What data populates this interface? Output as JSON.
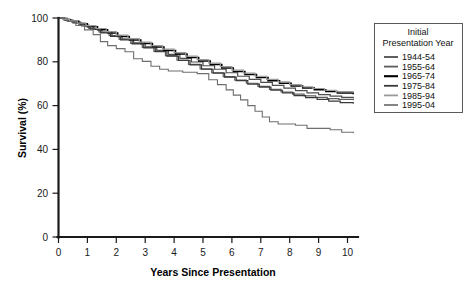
{
  "chart_data": {
    "type": "line",
    "title": "",
    "xlabel": "Years Since Presentation",
    "ylabel": "Survival (%)",
    "xlim": [
      0,
      10.5
    ],
    "ylim": [
      0,
      100
    ],
    "xticks": [
      "0",
      "1",
      "2",
      "3",
      "4",
      "5",
      "6",
      "7",
      "8",
      "9",
      "10"
    ],
    "yticks": [
      "0",
      "20",
      "40",
      "60",
      "80",
      "100"
    ],
    "grid": false,
    "legend_position": "top-right",
    "legend_title_line1": "Initial",
    "legend_title_line2": "Presentation Year",
    "series": [
      {
        "name": "1944-54",
        "color": "#4d4d4d",
        "width": 1.2,
        "points": [
          [
            0,
            100
          ],
          [
            0.15,
            99.4
          ],
          [
            0.35,
            98.6
          ],
          [
            0.6,
            97.6
          ],
          [
            0.9,
            96.3
          ],
          [
            1.2,
            94.8
          ],
          [
            1.5,
            93.4
          ],
          [
            1.85,
            92.0
          ],
          [
            2.2,
            90.4
          ],
          [
            2.6,
            88.6
          ],
          [
            3.0,
            86.8
          ],
          [
            3.4,
            85.2
          ],
          [
            3.8,
            83.4
          ],
          [
            4.2,
            81.6
          ],
          [
            4.6,
            79.9
          ],
          [
            5.0,
            78.2
          ],
          [
            5.4,
            76.6
          ],
          [
            5.8,
            75.0
          ],
          [
            6.2,
            73.4
          ],
          [
            6.6,
            72.0
          ],
          [
            7.0,
            70.6
          ],
          [
            7.4,
            69.2
          ],
          [
            7.8,
            68.0
          ],
          [
            8.2,
            66.8
          ],
          [
            8.6,
            65.8
          ],
          [
            9.0,
            65.0
          ],
          [
            9.4,
            64.3
          ],
          [
            9.8,
            63.8
          ],
          [
            10.2,
            63.4
          ]
        ]
      },
      {
        "name": "1955-64",
        "color": "#5c5c5c",
        "width": 1.2,
        "points": [
          [
            0,
            100
          ],
          [
            0.2,
            99.2
          ],
          [
            0.45,
            98.2
          ],
          [
            0.75,
            96.8
          ],
          [
            1.05,
            95.2
          ],
          [
            1.4,
            93.6
          ],
          [
            1.75,
            92.0
          ],
          [
            2.1,
            90.2
          ],
          [
            2.5,
            88.4
          ],
          [
            2.9,
            86.6
          ],
          [
            3.3,
            84.8
          ],
          [
            3.7,
            82.8
          ],
          [
            4.1,
            80.8
          ],
          [
            4.5,
            78.8
          ],
          [
            4.9,
            76.8
          ],
          [
            5.3,
            75.0
          ],
          [
            5.7,
            73.2
          ],
          [
            6.1,
            71.6
          ],
          [
            6.5,
            70.2
          ],
          [
            6.9,
            68.8
          ],
          [
            7.3,
            67.4
          ],
          [
            7.7,
            66.2
          ],
          [
            8.1,
            65.2
          ],
          [
            8.5,
            64.4
          ],
          [
            8.9,
            63.8
          ],
          [
            9.3,
            63.2
          ],
          [
            9.7,
            62.8
          ],
          [
            10.2,
            62.4
          ]
        ]
      },
      {
        "name": "1965-74",
        "color": "#000000",
        "width": 1.5,
        "points": [
          [
            0,
            100
          ],
          [
            0.18,
            99.3
          ],
          [
            0.4,
            98.5
          ],
          [
            0.7,
            97.4
          ],
          [
            1.0,
            96.0
          ],
          [
            1.35,
            94.6
          ],
          [
            1.7,
            93.2
          ],
          [
            2.05,
            91.6
          ],
          [
            2.45,
            90.0
          ],
          [
            2.85,
            88.4
          ],
          [
            3.25,
            86.8
          ],
          [
            3.65,
            85.2
          ],
          [
            4.05,
            83.6
          ],
          [
            4.45,
            82.0
          ],
          [
            4.85,
            80.4
          ],
          [
            5.25,
            78.8
          ],
          [
            5.65,
            77.2
          ],
          [
            6.05,
            75.6
          ],
          [
            6.45,
            74.2
          ],
          [
            6.85,
            72.8
          ],
          [
            7.25,
            71.4
          ],
          [
            7.65,
            70.2
          ],
          [
            8.05,
            69.0
          ],
          [
            8.45,
            68.0
          ],
          [
            8.85,
            67.2
          ],
          [
            9.25,
            66.4
          ],
          [
            9.65,
            65.8
          ],
          [
            10.2,
            65.2
          ]
        ]
      },
      {
        "name": "1975-84",
        "color": "#3a3a3a",
        "width": 1.2,
        "points": [
          [
            0,
            100
          ],
          [
            0.22,
            99.0
          ],
          [
            0.5,
            97.8
          ],
          [
            0.8,
            96.4
          ],
          [
            1.1,
            94.8
          ],
          [
            1.45,
            93.2
          ],
          [
            1.8,
            91.6
          ],
          [
            2.15,
            90.0
          ],
          [
            2.55,
            88.2
          ],
          [
            2.95,
            86.4
          ],
          [
            3.35,
            84.6
          ],
          [
            3.75,
            82.6
          ],
          [
            4.15,
            80.6
          ],
          [
            4.55,
            78.6
          ],
          [
            4.95,
            76.6
          ],
          [
            5.35,
            74.8
          ],
          [
            5.75,
            73.0
          ],
          [
            6.15,
            71.4
          ],
          [
            6.55,
            69.8
          ],
          [
            6.95,
            68.4
          ],
          [
            7.35,
            67.0
          ],
          [
            7.75,
            65.8
          ],
          [
            8.15,
            64.6
          ],
          [
            8.55,
            63.6
          ],
          [
            8.95,
            62.8
          ],
          [
            9.35,
            62.0
          ],
          [
            9.75,
            61.4
          ],
          [
            10.2,
            60.8
          ]
        ]
      },
      {
        "name": "1985-94",
        "color": "#9a9a9a",
        "width": 1.2,
        "points": [
          [
            0,
            100
          ],
          [
            0.16,
            99.4
          ],
          [
            0.38,
            98.7
          ],
          [
            0.65,
            97.7
          ],
          [
            0.95,
            96.5
          ],
          [
            1.3,
            95.2
          ],
          [
            1.65,
            93.8
          ],
          [
            2.0,
            92.2
          ],
          [
            2.4,
            90.6
          ],
          [
            2.8,
            89.0
          ],
          [
            3.2,
            87.4
          ],
          [
            3.6,
            85.8
          ],
          [
            4.0,
            84.2
          ],
          [
            4.4,
            82.6
          ],
          [
            4.8,
            81.0
          ],
          [
            5.2,
            79.4
          ],
          [
            5.6,
            77.8
          ],
          [
            6.0,
            76.2
          ],
          [
            6.4,
            74.8
          ],
          [
            6.8,
            73.4
          ],
          [
            7.2,
            72.0
          ],
          [
            7.6,
            70.8
          ],
          [
            8.0,
            69.6
          ],
          [
            8.4,
            68.6
          ],
          [
            8.8,
            67.8
          ],
          [
            9.2,
            67.0
          ],
          [
            9.6,
            66.4
          ],
          [
            10.2,
            65.8
          ]
        ]
      },
      {
        "name": "1995-04",
        "color": "#6e6e6e",
        "width": 1.1,
        "points": [
          [
            0,
            100
          ],
          [
            0.3,
            98.4
          ],
          [
            0.6,
            96.6
          ],
          [
            0.9,
            94.6
          ],
          [
            1.2,
            92.4
          ],
          [
            1.45,
            89.2
          ],
          [
            1.7,
            87.4
          ],
          [
            2.0,
            86.0
          ],
          [
            2.3,
            84.6
          ],
          [
            2.6,
            81.4
          ],
          [
            2.9,
            80.2
          ],
          [
            3.2,
            78.0
          ],
          [
            3.5,
            76.6
          ],
          [
            3.8,
            75.8
          ],
          [
            4.3,
            75.2
          ],
          [
            4.8,
            74.6
          ],
          [
            5.2,
            71.8
          ],
          [
            5.5,
            69.6
          ],
          [
            5.8,
            67.2
          ],
          [
            6.05,
            64.8
          ],
          [
            6.3,
            62.6
          ],
          [
            6.55,
            60.0
          ],
          [
            6.8,
            57.4
          ],
          [
            7.05,
            54.8
          ],
          [
            7.3,
            52.6
          ],
          [
            7.6,
            51.6
          ],
          [
            8.2,
            51.0
          ],
          [
            8.6,
            49.6
          ],
          [
            9.4,
            49.0
          ],
          [
            9.8,
            47.8
          ],
          [
            10.2,
            47.4
          ]
        ]
      }
    ]
  }
}
